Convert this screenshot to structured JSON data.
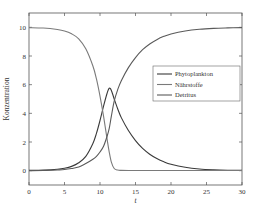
{
  "chart_data": {
    "type": "line",
    "title": "",
    "xlabel": "t",
    "ylabel": "Konzentration",
    "xlim": [
      0,
      30
    ],
    "ylim": [
      -1,
      11
    ],
    "xticks": [
      0,
      5,
      10,
      15,
      20,
      25,
      30
    ],
    "yticks": [
      0,
      2,
      4,
      6,
      8,
      10
    ],
    "grid": false,
    "legend_position": "center-right",
    "x": [
      0,
      2,
      4,
      5,
      6,
      7,
      8,
      9,
      9.5,
      10,
      10.5,
      11,
      11.3,
      11.6,
      12,
      12.5,
      13,
      14,
      15,
      16,
      17,
      18,
      19,
      20,
      22,
      24,
      26,
      28,
      30
    ],
    "series": [
      {
        "name": "Phytoplankton",
        "color": "#3a3a3a",
        "values": [
          0.02,
          0.04,
          0.1,
          0.17,
          0.3,
          0.55,
          1.0,
          1.9,
          2.6,
          3.5,
          4.5,
          5.4,
          5.75,
          5.6,
          5.0,
          4.3,
          3.7,
          2.8,
          2.1,
          1.55,
          1.15,
          0.85,
          0.62,
          0.45,
          0.24,
          0.12,
          0.06,
          0.03,
          0.02
        ]
      },
      {
        "name": "Nährstoffe",
        "color": "#7a7a7a",
        "values": [
          9.98,
          9.95,
          9.85,
          9.75,
          9.55,
          9.2,
          8.5,
          7.3,
          6.4,
          5.2,
          3.8,
          2.2,
          1.3,
          0.6,
          0.15,
          0.04,
          0.02,
          0.01,
          0.01,
          0.01,
          0.01,
          0.01,
          0.01,
          0.01,
          0.01,
          0.01,
          0.01,
          0.01,
          0.01
        ]
      },
      {
        "name": "Detritus",
        "color": "#5a5a5a",
        "values": [
          0.0,
          0.01,
          0.05,
          0.08,
          0.15,
          0.25,
          0.5,
          0.8,
          1.0,
          1.3,
          1.7,
          2.4,
          2.95,
          3.8,
          4.85,
          5.66,
          6.28,
          7.19,
          7.89,
          8.44,
          8.84,
          9.14,
          9.37,
          9.54,
          9.75,
          9.87,
          9.93,
          9.96,
          9.98
        ]
      }
    ]
  },
  "legend": {
    "items": [
      "Phytoplankton",
      "Nährstoffe",
      "Detritus"
    ]
  },
  "axes": {
    "xlabel": "t",
    "ylabel": "Konzentration",
    "xtick_labels": [
      "0",
      "5",
      "10",
      "15",
      "20",
      "25",
      "30"
    ],
    "ytick_labels": [
      "0",
      "2",
      "4",
      "6",
      "8",
      "10"
    ]
  }
}
